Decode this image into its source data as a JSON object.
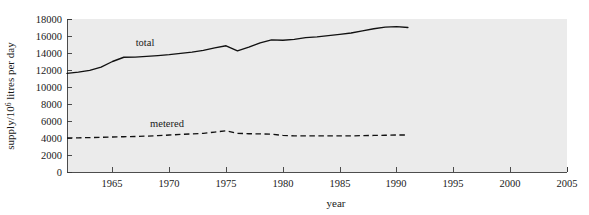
{
  "figure": {
    "background_color": "#ffffff",
    "plot_background_color": "#ebebeb",
    "line_color": "#111111",
    "axis_color": "#3a3a3a"
  },
  "axes": {
    "x_title": "year",
    "y_title_prefix": "supply/10",
    "y_title_exponent": "6",
    "y_title_suffix": " litres per day",
    "x_tick_labels": [
      "1965",
      "1970",
      "1975",
      "1980",
      "1985",
      "1990",
      "1995",
      "2000",
      "2005"
    ],
    "y_tick_labels": [
      "0",
      "2000",
      "4000",
      "6000",
      "8000",
      "10000",
      "12000",
      "14000",
      "16000",
      "18000"
    ]
  },
  "series_labels": {
    "total": "total",
    "metered": "metered"
  },
  "chart_data": {
    "type": "line",
    "title": "",
    "xlabel": "year",
    "ylabel": "supply/10^6 litres per day",
    "xlim": [
      1961,
      2005
    ],
    "ylim": [
      0,
      18000
    ],
    "x_ticks": [
      1965,
      1970,
      1975,
      1980,
      1985,
      1990,
      1995,
      2000,
      2005
    ],
    "y_ticks": [
      0,
      2000,
      4000,
      6000,
      8000,
      10000,
      12000,
      14000,
      16000,
      18000
    ],
    "grid": false,
    "legend": "inline-annotations",
    "x": [
      1961,
      1962,
      1963,
      1964,
      1965,
      1966,
      1967,
      1968,
      1969,
      1970,
      1971,
      1972,
      1973,
      1974,
      1975,
      1976,
      1977,
      1978,
      1979,
      1980,
      1981,
      1982,
      1983,
      1984,
      1985,
      1986,
      1987,
      1988,
      1989,
      1990,
      1991
    ],
    "series": [
      {
        "name": "total",
        "style": "solid",
        "values": [
          11600,
          11750,
          11950,
          12350,
          13000,
          13500,
          13520,
          13600,
          13700,
          13800,
          13950,
          14100,
          14300,
          14600,
          14850,
          14250,
          14700,
          15200,
          15550,
          15500,
          15600,
          15800,
          15900,
          16050,
          16200,
          16350,
          16600,
          16850,
          17050,
          17100,
          17000
        ]
      },
      {
        "name": "metered",
        "style": "dashed",
        "values": [
          4000,
          4020,
          4050,
          4080,
          4120,
          4150,
          4180,
          4220,
          4280,
          4350,
          4420,
          4480,
          4550,
          4700,
          4850,
          4550,
          4500,
          4480,
          4450,
          4300,
          4250,
          4250,
          4250,
          4250,
          4250,
          4250,
          4280,
          4300,
          4320,
          4350,
          4350
        ]
      }
    ],
    "annotations": [
      {
        "text": "total",
        "x": 1966.5,
        "y": 15200
      },
      {
        "text": "metered",
        "x": 1968.5,
        "y": 5400
      }
    ]
  }
}
